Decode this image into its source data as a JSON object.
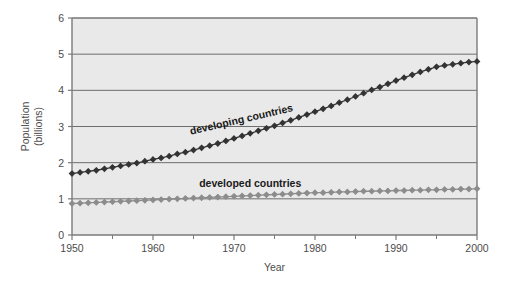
{
  "chart_data": {
    "type": "line",
    "title": "",
    "subtitle": "",
    "xlabel": "Year",
    "ylabel": "Population\n(billions)",
    "ylabel_line1": "Population",
    "ylabel_line2": "(billions)",
    "xlim": [
      1950,
      2000
    ],
    "ylim": [
      0,
      6
    ],
    "grid": "horizontal",
    "legend_position": "inline-annotation",
    "x_major_ticks": [
      1950,
      1960,
      1970,
      1980,
      1990,
      2000
    ],
    "x_major_tick_labels": [
      "1950",
      "1960",
      "1970",
      "1980",
      "1990",
      "2000"
    ],
    "x_minor_ticks": [
      1955,
      1965,
      1975,
      1985,
      1995
    ],
    "y_ticks": [
      0,
      1,
      2,
      3,
      4,
      5,
      6
    ],
    "y_tick_labels": [
      "0",
      "1",
      "2",
      "3",
      "4",
      "5",
      "6"
    ],
    "x": [
      1950,
      1951,
      1952,
      1953,
      1954,
      1955,
      1956,
      1957,
      1958,
      1959,
      1960,
      1961,
      1962,
      1963,
      1964,
      1965,
      1966,
      1967,
      1968,
      1969,
      1970,
      1971,
      1972,
      1973,
      1974,
      1975,
      1976,
      1977,
      1978,
      1979,
      1980,
      1981,
      1982,
      1983,
      1984,
      1985,
      1986,
      1987,
      1988,
      1989,
      1990,
      1991,
      1992,
      1993,
      1994,
      1995,
      1996,
      1997,
      1998,
      1999,
      2000
    ],
    "series": [
      {
        "name": "developing countries",
        "color": "#333333",
        "marker": "diamond",
        "annotation": "developing countries",
        "annotation_rotation_deg": -13,
        "values": [
          1.7,
          1.73,
          1.76,
          1.79,
          1.83,
          1.87,
          1.91,
          1.95,
          1.99,
          2.04,
          2.09,
          2.13,
          2.18,
          2.24,
          2.29,
          2.35,
          2.41,
          2.47,
          2.53,
          2.6,
          2.67,
          2.74,
          2.81,
          2.88,
          2.95,
          3.02,
          3.1,
          3.17,
          3.25,
          3.33,
          3.41,
          3.49,
          3.57,
          3.66,
          3.74,
          3.83,
          3.92,
          4.01,
          4.09,
          4.18,
          4.27,
          4.35,
          4.43,
          4.51,
          4.58,
          4.65,
          4.69,
          4.72,
          4.75,
          4.78,
          4.8
        ]
      },
      {
        "name": "developed countries",
        "color": "#8c8c8c",
        "marker": "diamond",
        "annotation": "developed countries",
        "annotation_rotation_deg": 0,
        "values": [
          0.87,
          0.88,
          0.89,
          0.9,
          0.91,
          0.92,
          0.93,
          0.94,
          0.95,
          0.96,
          0.97,
          0.98,
          0.99,
          1.0,
          1.01,
          1.02,
          1.03,
          1.04,
          1.05,
          1.06,
          1.07,
          1.08,
          1.09,
          1.1,
          1.11,
          1.12,
          1.13,
          1.14,
          1.15,
          1.16,
          1.17,
          1.17,
          1.18,
          1.19,
          1.19,
          1.2,
          1.21,
          1.21,
          1.22,
          1.22,
          1.23,
          1.23,
          1.24,
          1.24,
          1.25,
          1.25,
          1.26,
          1.26,
          1.27,
          1.27,
          1.28
        ]
      }
    ],
    "colors": {
      "plot_background": "#e9e9e9",
      "gridline": "#6e6e6e",
      "axis": "#7a7a7a",
      "text": "#4d4d4d",
      "developing": "#333333",
      "developed": "#8c8c8c",
      "page_background": "#ffffff"
    },
    "geometry": {
      "plot_left": 72,
      "plot_right": 477,
      "plot_top": 18,
      "plot_bottom": 235
    }
  }
}
